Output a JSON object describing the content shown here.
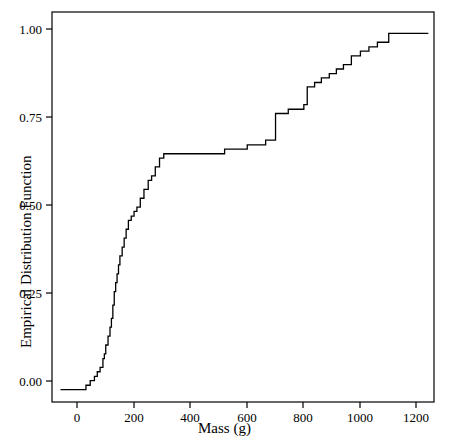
{
  "chart_data": {
    "type": "line",
    "title": "",
    "subtitle": "",
    "xlabel": "Mass (g)",
    "ylabel": "Empirical Distribution Function",
    "xlim": [
      -90,
      1260
    ],
    "ylim": [
      -0.035,
      1.06
    ],
    "xticks": [
      0,
      200,
      400,
      600,
      800,
      1000,
      1200
    ],
    "xtick_labels": [
      "0",
      "200",
      "400",
      "600",
      "800",
      "1000",
      "1200"
    ],
    "yticks": [
      0.0,
      0.25,
      0.5,
      0.75,
      1.0
    ],
    "ytick_labels": [
      "0.00",
      "0.25",
      "0.50",
      "0.75",
      "1.00"
    ],
    "grid": false,
    "legend": null,
    "line_color": "#000000",
    "frame_color": "#000000",
    "series": [
      {
        "name": "Empirical Distribution Function",
        "step": "post",
        "x": [
          -60,
          10,
          30,
          45,
          60,
          70,
          80,
          90,
          95,
          100,
          108,
          115,
          120,
          125,
          130,
          135,
          140,
          145,
          150,
          158,
          165,
          172,
          180,
          190,
          200,
          210,
          222,
          235,
          250,
          262,
          275,
          290,
          305,
          470,
          520,
          560,
          600,
          640,
          665,
          690,
          700,
          745,
          775,
          800,
          812,
          838,
          862,
          890,
          915,
          940,
          968,
          1000,
          1030,
          1060,
          1100,
          1240
        ],
        "y": [
          0.0,
          0.0,
          0.012,
          0.025,
          0.037,
          0.05,
          0.062,
          0.087,
          0.1,
          0.125,
          0.15,
          0.175,
          0.2,
          0.237,
          0.275,
          0.3,
          0.325,
          0.35,
          0.375,
          0.4,
          0.425,
          0.45,
          0.475,
          0.487,
          0.5,
          0.512,
          0.537,
          0.562,
          0.587,
          0.6,
          0.625,
          0.65,
          0.662,
          0.662,
          0.675,
          0.675,
          0.687,
          0.687,
          0.7,
          0.7,
          0.775,
          0.787,
          0.787,
          0.8,
          0.85,
          0.862,
          0.875,
          0.887,
          0.9,
          0.912,
          0.937,
          0.95,
          0.962,
          0.975,
          1.0,
          1.0
        ]
      }
    ]
  },
  "axis": {
    "x_title": "Mass (g)",
    "y_title": "Empirical Distribution Function"
  }
}
